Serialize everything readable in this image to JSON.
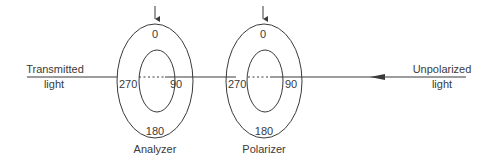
{
  "diagram": {
    "left_label_line1": "Transmitted",
    "left_label_line2": "light",
    "right_label_line1": "Unpolarized",
    "right_label_line2": "light",
    "analyzer": {
      "name": "Analyzer",
      "angle_top": "0",
      "angle_right": "90",
      "angle_bottom": "180",
      "angle_left": "270"
    },
    "polarizer": {
      "name": "Polarizer",
      "angle_top": "0",
      "angle_right": "90",
      "angle_bottom": "180",
      "angle_left": "270"
    },
    "colors": {
      "stroke": "#3a3a3a",
      "background": "#ffffff"
    }
  }
}
